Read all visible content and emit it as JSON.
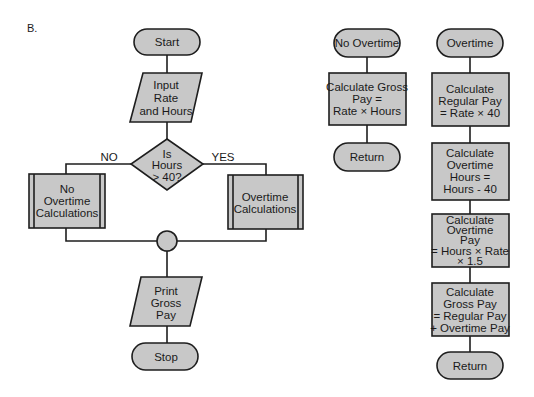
{
  "figure_label": "B.",
  "colors": {
    "shape_fill": "#c8c8c8",
    "stroke": "#1e1e1e",
    "background": "#ffffff"
  },
  "main_flow": {
    "start": "Start",
    "input": [
      "Input",
      "Rate",
      "and Hours"
    ],
    "decision": [
      "Is",
      "Hours",
      "> 40?"
    ],
    "branch_no": "NO",
    "branch_yes": "YES",
    "no_overtime_subprocess": [
      "No",
      "Overtime",
      "Calculations"
    ],
    "overtime_subprocess": [
      "Overtime",
      "Calculations"
    ],
    "output": [
      "Print",
      "Gross",
      "Pay"
    ],
    "stop": "Stop"
  },
  "no_overtime_module": {
    "entry": "No Overtime",
    "process": [
      "Calculate Gross",
      "Pay =",
      "Rate  ×  Hours"
    ],
    "exit": "Return"
  },
  "overtime_module": {
    "entry": "Overtime",
    "steps": [
      [
        "Calculate",
        "Regular Pay",
        "= Rate  ×  40"
      ],
      [
        "Calculate",
        "Overtime",
        "Hours  =",
        "Hours - 40"
      ],
      [
        "Calculate",
        "Overtime",
        "Pay",
        "= Hours × Rate",
        "×  1.5"
      ],
      [
        "Calculate",
        "Gross Pay",
        "= Regular Pay",
        "+ Overtime Pay"
      ]
    ],
    "exit": "Return"
  }
}
